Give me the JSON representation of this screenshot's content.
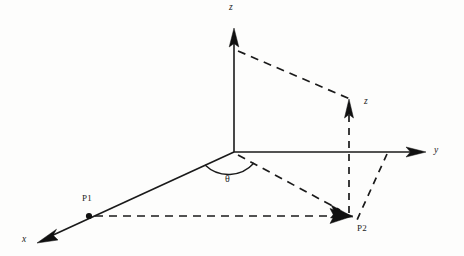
{
  "figure": {
    "type": "3d-coordinate-diagram",
    "background_color": "#fdfdfc",
    "line_color": "#1a1a1a",
    "width": 464,
    "height": 256
  },
  "axes": [
    {
      "id": "z",
      "label": "z",
      "origin": [
        234,
        152
      ],
      "tip": [
        234,
        29
      ],
      "style": "solid"
    },
    {
      "id": "y",
      "label": "y",
      "origin": [
        234,
        152
      ],
      "tip": [
        425,
        152
      ],
      "style": "solid"
    },
    {
      "id": "x",
      "label": "x",
      "origin": [
        234,
        152
      ],
      "tip": [
        38,
        242
      ],
      "style": "solid"
    }
  ],
  "labels": {
    "z_axis": "z",
    "y_axis": "y",
    "x_axis": "x",
    "z_height": "z",
    "point1": "P1",
    "point2": "P2",
    "angle": "θ"
  },
  "points": [
    {
      "name": "P1",
      "label": "P1",
      "position": [
        89,
        216
      ],
      "marker": "dot",
      "on_axis": "x"
    },
    {
      "name": "P2",
      "label": "P2",
      "position": [
        352,
        216
      ],
      "marker": "arrow",
      "on_axis": "projected"
    }
  ],
  "vectors": [
    {
      "from": "origin",
      "to": "P2",
      "style": "dashed",
      "arrow": true
    },
    {
      "from": "P1",
      "to": "P2",
      "style": "dashed",
      "arrow": true,
      "orientation": "horizontal"
    },
    {
      "from": "P2",
      "to": "z-height-top",
      "style": "dashed",
      "arrow": true,
      "orientation": "vertical"
    },
    {
      "from": "z-axis",
      "to": "z-height-top",
      "style": "dashed",
      "arrow": false
    },
    {
      "from": "y-axis",
      "to": "P2",
      "style": "dashed",
      "arrow": false,
      "orientation": "diagonal"
    }
  ],
  "angle_arc": {
    "label": "θ",
    "vertex": [
      234,
      152
    ],
    "between": [
      "x-axis",
      "origin-to-P2-projection"
    ],
    "label_position": [
      228,
      180
    ]
  },
  "z_height_marker": {
    "label": "z",
    "base": [
      349,
      152
    ],
    "tip": [
      349,
      100
    ],
    "label_position": [
      367,
      101
    ]
  }
}
